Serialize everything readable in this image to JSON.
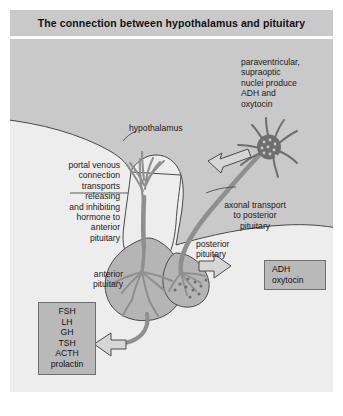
{
  "figure": {
    "title": "The connection between hypothalamus and pituitary",
    "background_color": "#c9c9c9",
    "panel_color": "#e6e6e6",
    "vessel_color": "#9a9a9a",
    "box_fill": "#b9b9b9",
    "box_border": "#6f6f6f"
  },
  "labels": {
    "paraventricular": "paraventricular,\nsupraoptic\nnuclei produce\nADH and\noxytocin",
    "hypothalamus": "hypothalamus",
    "portal_venous": "portal venous\nconnection\ntransports\nreleasing\nand inhibiting\nhormone to\nanterior\npituitary",
    "axonal_transport": "axonal transport\nto posterior\npituitary",
    "posterior_pituitary": "posterior\npituitary",
    "anterior_pituitary": "anterior\npituitary"
  },
  "boxes": {
    "adh": {
      "lines": "ADH\noxytocin",
      "items": [
        "ADH",
        "oxytocin"
      ]
    },
    "anterior_hormones": {
      "lines": "FSH\nLH\nGH\nTSH\nACTH\nprolactin",
      "items": [
        "FSH",
        "LH",
        "GH",
        "TSH",
        "ACTH",
        "prolactin"
      ]
    }
  },
  "icons": {
    "arrow_to_adh": "arrow-right-icon",
    "arrow_to_hormones": "arrow-left-icon",
    "arrow_axonal": "arrow-left-icon",
    "nucleus_cluster": "neuron-nucleus-icon"
  }
}
